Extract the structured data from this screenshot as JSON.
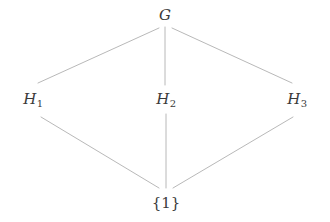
{
  "diagram": {
    "kind": "hasse-diagram",
    "title": "",
    "background_color": "#ffffff",
    "edge_color": "#b0b0b0",
    "label_color": "#3a3a3a",
    "nodes": [
      {
        "id": "G",
        "symbol": "G",
        "subscript": "",
        "style": "italic",
        "label": "G",
        "x": 165,
        "y": 15
      },
      {
        "id": "H1",
        "symbol": "H",
        "subscript": "1",
        "style": "italic",
        "label": "H1",
        "x": 33,
        "y": 99
      },
      {
        "id": "H2",
        "symbol": "H",
        "subscript": "2",
        "style": "italic",
        "label": "H2",
        "x": 166,
        "y": 99
      },
      {
        "id": "H3",
        "symbol": "H",
        "subscript": "3",
        "style": "italic",
        "label": "H3",
        "x": 297,
        "y": 99
      },
      {
        "id": "1",
        "symbol": "{1}",
        "subscript": "",
        "style": "upright",
        "label": "{1}",
        "x": 166,
        "y": 203
      }
    ],
    "edges": [
      {
        "from": "H1",
        "to": "G",
        "x1": 38,
        "y1": 83,
        "x2": 159,
        "y2": 28
      },
      {
        "from": "H2",
        "to": "G",
        "x1": 165,
        "y1": 85,
        "x2": 165,
        "y2": 27
      },
      {
        "from": "H3",
        "to": "G",
        "x1": 292,
        "y1": 83,
        "x2": 172,
        "y2": 28
      },
      {
        "from": "1",
        "to": "H1",
        "x1": 159,
        "y1": 188,
        "x2": 41,
        "y2": 117
      },
      {
        "from": "1",
        "to": "H2",
        "x1": 166,
        "y1": 188,
        "x2": 166,
        "y2": 114
      },
      {
        "from": "1",
        "to": "H3",
        "x1": 173,
        "y1": 188,
        "x2": 293,
        "y2": 117
      }
    ]
  }
}
